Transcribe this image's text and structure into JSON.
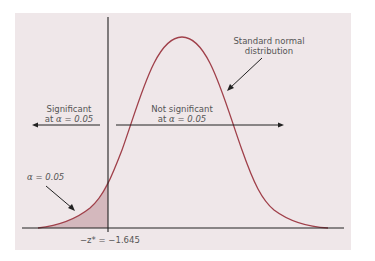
{
  "diagram": {
    "title": "",
    "curve_label": [
      "Standard normal",
      "distribution"
    ],
    "left_region": {
      "line1": "Significant",
      "line2_prefix": "at ",
      "alpha_symbol": "α",
      "line2_value": " = 0.05"
    },
    "right_region": {
      "line1": "Not significant",
      "line2_prefix": "at ",
      "alpha_symbol": "α",
      "line2_value": " = 0.05"
    },
    "tail_label": {
      "alpha_symbol": "α",
      "value": " = 0.05"
    },
    "critical_value_label": "−z* = −1.645",
    "colors": {
      "background": "#efe7e9",
      "curve": "#a0404a",
      "shaded_tail": "#d4b8bd",
      "axis": "#222222",
      "text": "#555555"
    }
  }
}
